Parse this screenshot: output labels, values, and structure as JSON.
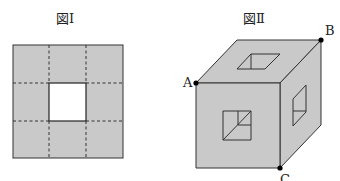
{
  "figure1": {
    "title": "図Ⅰ",
    "description": "Square net divided into 3x3 grid by dashed lines, center square cut out",
    "fill_color": "#c9c9c9",
    "hole_color": "#ffffff"
  },
  "figure2": {
    "title": "図Ⅱ",
    "description": "Cube with square holes through the centers of its faces",
    "fill_color": "#c9c9c9",
    "points": {
      "A": "A",
      "B": "B",
      "C": "C"
    }
  }
}
